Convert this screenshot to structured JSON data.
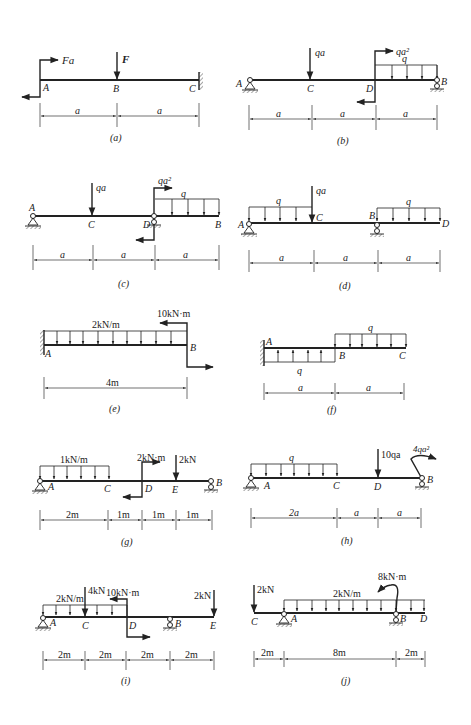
{
  "figures": [
    {
      "id": "a",
      "caption": "(a)",
      "points": [
        "A",
        "B",
        "C"
      ],
      "loads": {
        "moment_A": "Fa",
        "force_B": "F"
      },
      "dims": [
        "a",
        "a"
      ],
      "support_C": "fixed"
    },
    {
      "id": "b",
      "caption": "(b)",
      "points": [
        "A",
        "C",
        "D",
        "B"
      ],
      "loads": {
        "force_C": "qa",
        "moment_D": "qa²",
        "dist_DB": "q"
      },
      "dims": [
        "a",
        "a",
        "a"
      ]
    },
    {
      "id": "c",
      "caption": "(c)",
      "points": [
        "A",
        "C",
        "D",
        "B"
      ],
      "loads": {
        "force_C": "qa",
        "moment_D": "qa²",
        "dist_DB": "q"
      },
      "dims": [
        "a",
        "a",
        "a"
      ]
    },
    {
      "id": "d",
      "caption": "(d)",
      "points": [
        "A",
        "C",
        "B",
        "D"
      ],
      "loads": {
        "force_C": "qa",
        "dist_AC": "q",
        "dist_BD": "q"
      },
      "dims": [
        "a",
        "a",
        "a"
      ]
    },
    {
      "id": "e",
      "caption": "(e)",
      "points": [
        "A",
        "B"
      ],
      "loads": {
        "dist_AB": "2kN/m",
        "moment_B": "10kN·m"
      },
      "dims": [
        "4m"
      ]
    },
    {
      "id": "f",
      "caption": "(f)",
      "points": [
        "A",
        "B",
        "C"
      ],
      "loads": {
        "dist_AB_up": "q",
        "dist_BC_down": "q"
      },
      "dims": [
        "a",
        "a"
      ]
    },
    {
      "id": "g",
      "caption": "(g)",
      "points": [
        "A",
        "C",
        "D",
        "E",
        "B"
      ],
      "loads": {
        "dist_AC": "1kN/m",
        "moment_D": "2kN·m",
        "force_E": "2kN"
      },
      "dims": [
        "2m",
        "1m",
        "1m",
        "1m"
      ]
    },
    {
      "id": "h",
      "caption": "(h)",
      "points": [
        "A",
        "C",
        "D",
        "B"
      ],
      "loads": {
        "dist_AC": "q",
        "force_D": "10qa",
        "moment_B": "4qa²"
      },
      "dims": [
        "2a",
        "a",
        "a"
      ]
    },
    {
      "id": "i",
      "caption": "(i)",
      "points": [
        "A",
        "C",
        "D",
        "B",
        "E"
      ],
      "loads": {
        "dist_AD": "2kN/m",
        "force_C": "4kN",
        "moment_D": "10kN·m",
        "force_E": "2kN"
      },
      "dims": [
        "2m",
        "2m",
        "2m",
        "2m"
      ]
    },
    {
      "id": "j",
      "caption": "(j)",
      "points": [
        "C",
        "A",
        "B",
        "D"
      ],
      "loads": {
        "force_C": "2kN",
        "dist_AD": "2kN/m",
        "moment_B": "8kN·m"
      },
      "dims": [
        "2m",
        "8m",
        "2m"
      ]
    }
  ]
}
